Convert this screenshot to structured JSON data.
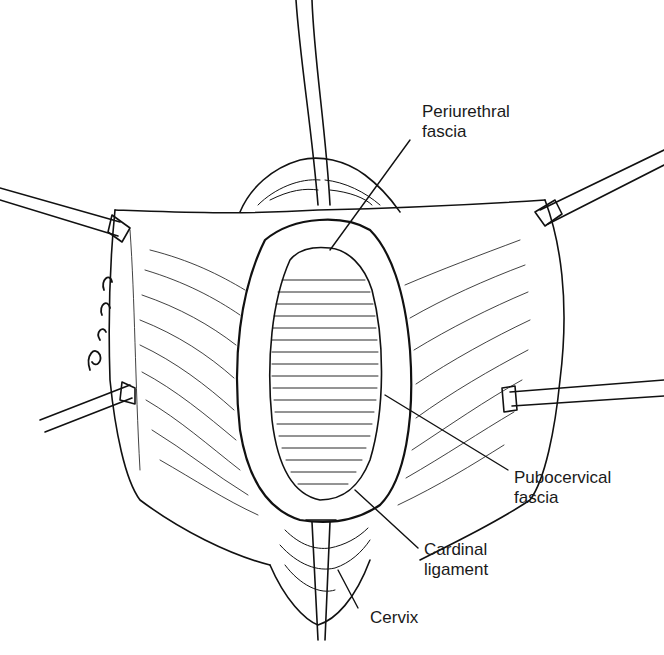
{
  "figure": {
    "type": "surgical illustration",
    "ink_color": "#111111",
    "background_color": "#ffffff",
    "artist_signature": "Ricor"
  },
  "labels": [
    {
      "id": "periurethral",
      "line1": "Periurethral",
      "line2": "fascia"
    },
    {
      "id": "pubocervical",
      "line1": "Pubocervical",
      "line2": "fascia"
    },
    {
      "id": "cardinal",
      "line1": "Cardinal",
      "line2": "ligament"
    },
    {
      "id": "cervix",
      "line1": "Cervix",
      "line2": ""
    }
  ],
  "instruments": [
    {
      "name": "catheter-top"
    },
    {
      "name": "retractor-upper-left"
    },
    {
      "name": "retractor-upper-right"
    },
    {
      "name": "retractor-lower-left"
    },
    {
      "name": "retractor-right"
    },
    {
      "name": "tenaculum-bottom"
    }
  ]
}
